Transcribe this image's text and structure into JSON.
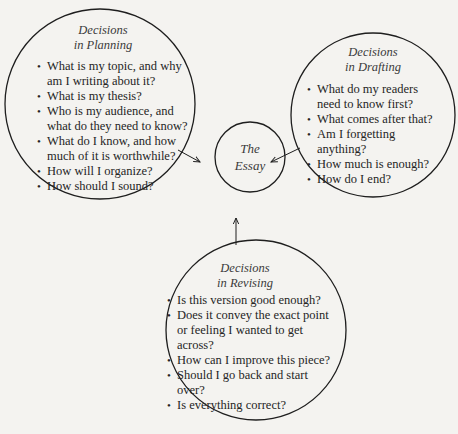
{
  "diagram": {
    "center": {
      "line1": "The",
      "line2": "Essay"
    },
    "planning": {
      "title_line1": "Decisions",
      "title_line2": "in Planning",
      "items": [
        "What is my topic, and why am I writing about it?",
        "What is my thesis?",
        "Who is my audience, and what do they need to know?",
        "What do I know, and how much of it is worthwhile?",
        "How will I organize?",
        "How should I sound?"
      ]
    },
    "drafting": {
      "title_line1": "Decisions",
      "title_line2": "in Drafting",
      "items": [
        "What do my readers need to know first?",
        "What comes after that?",
        "Am I forgetting anything?",
        "How much is enough?",
        "How do I end?"
      ]
    },
    "revising": {
      "title_line1": "Decisions",
      "title_line2": "in Revising",
      "items": [
        "Is this version good enough?",
        "Does it convey the exact point or feeling I wanted to get across?",
        "How can I improve this piece?",
        "Should I go back and start over?",
        "Is everything correct?"
      ]
    },
    "colors": {
      "line": "#1e1e1e",
      "background": "#f4f3f0"
    }
  }
}
